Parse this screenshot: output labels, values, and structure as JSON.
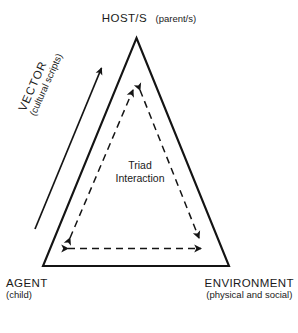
{
  "figure": {
    "type": "triangle-relationship-diagram",
    "background_color": "#ffffff",
    "stroke_color": "#141414",
    "vertices": {
      "host": {
        "title": "HOST/S",
        "subtitle": "(parent/s)",
        "position": "top-apex"
      },
      "agent": {
        "title": "AGENT",
        "subtitle": "(child)",
        "position": "bottom-left"
      },
      "environment": {
        "title": "ENVIRONMENT",
        "subtitle": "(physical and social)",
        "position": "bottom-right"
      }
    },
    "vector_arrow": {
      "title": "VECTOR",
      "subtitle": "(cultural scripts)",
      "style": "solid-single-headed-arrow",
      "direction": "from agent vertex toward host vertex",
      "position": "outside left edge"
    },
    "inner_triangle": {
      "line1": "Triad",
      "line2": "Interaction",
      "style": "dashed-double-headed-arrows",
      "edges": [
        "agent-to-host",
        "host-to-environment",
        "agent-to-environment"
      ]
    }
  }
}
